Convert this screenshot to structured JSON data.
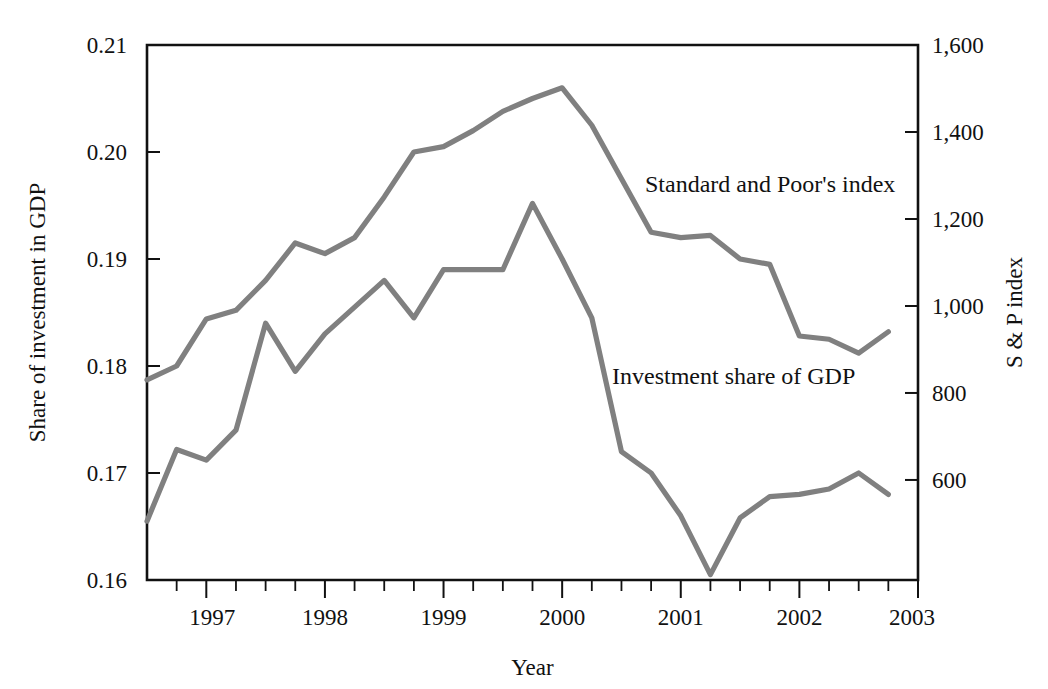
{
  "chart_data": {
    "type": "line",
    "title": "",
    "xlabel": "Year",
    "ylabel_left": "Share of investment in GDP",
    "ylabel_right": "S & P index",
    "grid": false,
    "legend_position": "inline-annotation",
    "x_axis": {
      "label": "Year",
      "tick_labels": [
        "1997",
        "1998",
        "1999",
        "2000",
        "2001",
        "2002",
        "2003"
      ],
      "tick_values": [
        1997,
        1998,
        1999,
        2000,
        2001,
        2002,
        2003
      ],
      "minor_ticks_per_year": 4,
      "xlim": [
        1996.5,
        2003.0
      ]
    },
    "y_axis_left": {
      "label": "Share of investment in GDP",
      "tick_labels": [
        "0.21",
        "0.20",
        "0.19",
        "0.18",
        "0.17",
        "0.16"
      ],
      "tick_values": [
        0.21,
        0.2,
        0.19,
        0.18,
        0.17,
        0.16
      ],
      "ylim": [
        0.16,
        0.21
      ]
    },
    "y_axis_right": {
      "label": "S & P index",
      "tick_labels": [
        "1,600",
        "1,400",
        "1,200",
        "1,000",
        "800",
        "600"
      ],
      "tick_values": [
        1600,
        1400,
        1200,
        1000,
        800,
        600
      ],
      "ylim": [
        370,
        1600
      ]
    },
    "x": [
      1996.5,
      1996.75,
      1997.0,
      1997.25,
      1997.5,
      1997.75,
      1998.0,
      1998.25,
      1998.5,
      1998.75,
      1999.0,
      1999.25,
      1999.5,
      1999.75,
      2000.0,
      2000.25,
      2000.5,
      2000.75,
      2001.0,
      2001.25,
      2001.5,
      2001.75,
      2002.0,
      2002.25,
      2002.5,
      2002.75
    ],
    "series": [
      {
        "name": "Standard and Poor's index",
        "axis": "right",
        "color": "#808080",
        "annotation": "Standard and Poor's index",
        "values_left_scale": [
          0.1787,
          0.18,
          0.1844,
          0.1852,
          0.188,
          0.1915,
          0.1905,
          0.192,
          0.1958,
          0.2,
          0.2005,
          0.202,
          0.2038,
          0.205,
          0.206,
          0.2025,
          0.1975,
          0.1925,
          0.192,
          0.1922,
          0.19,
          0.1895,
          0.1828,
          0.1825,
          0.1812,
          0.1832
        ],
        "values": [
          830,
          860,
          968,
          988,
          1057,
          1143,
          1118,
          1155,
          1248,
          1352,
          1364,
          1401,
          1445,
          1475,
          1500,
          1414,
          1291,
          1168,
          1155,
          1160,
          1106,
          1094,
          929,
          921,
          889,
          938
        ]
      },
      {
        "name": "Investment share of GDP",
        "axis": "left",
        "color": "#808080",
        "annotation": "Investment share of GDP",
        "values": [
          0.1655,
          0.1722,
          0.1712,
          0.174,
          0.184,
          0.1795,
          0.183,
          0.1855,
          0.188,
          0.1845,
          0.189,
          0.189,
          0.189,
          0.1952,
          0.19,
          0.1845,
          0.172,
          0.17,
          0.166,
          0.1605,
          0.1658,
          0.1678,
          0.168,
          0.1685,
          0.17,
          0.168
        ]
      }
    ],
    "annotations": [
      {
        "text": "Standard and Poor's index",
        "x_px": 645,
        "y_px": 192
      },
      {
        "text": "Investment share of GDP",
        "x_px": 612,
        "y_px": 384
      }
    ],
    "plot_area_px": {
      "left": 147,
      "top": 45,
      "right": 918,
      "bottom": 580
    }
  }
}
